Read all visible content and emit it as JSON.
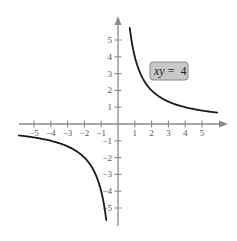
{
  "chart_data": {
    "type": "line",
    "title": "",
    "equation_label": "xy = 4",
    "equation_parts": {
      "vars": "xy",
      "rest": " =  4"
    },
    "function": "y = 4/x",
    "xlabel": "",
    "ylabel": "",
    "xlim": [
      -6,
      6.5
    ],
    "ylim": [
      -6,
      6.5
    ],
    "grid": false,
    "x_ticks": [
      -5,
      -4,
      -3,
      -2,
      -1,
      1,
      2,
      3,
      4,
      5
    ],
    "y_ticks": [
      -5,
      -4,
      -3,
      -2,
      -1,
      1,
      2,
      3,
      4,
      5
    ],
    "x_tick_labels": [
      "−5",
      "−4",
      "−3",
      "−2",
      "−1",
      "1",
      "2",
      "3",
      "4",
      "5"
    ],
    "y_tick_labels": [
      "−5",
      "−4",
      "−3",
      "−2",
      "−1",
      "1",
      "2",
      "3",
      "4",
      "5"
    ],
    "series": [
      {
        "name": "upper branch (x > 0)",
        "x": [
          0.7,
          0.8,
          1,
          1.5,
          2,
          2.5,
          3,
          4,
          5,
          5.9
        ],
        "y": [
          5.71,
          5,
          4,
          2.67,
          2,
          1.6,
          1.33,
          1,
          0.8,
          0.68
        ]
      },
      {
        "name": "lower branch (x < 0)",
        "x": [
          -5.9,
          -5,
          -4,
          -3,
          -2.5,
          -2,
          -1.5,
          -1,
          -0.8,
          -0.7
        ],
        "y": [
          -0.68,
          -0.8,
          -1,
          -1.33,
          -1.6,
          -2,
          -2.67,
          -4,
          -5,
          -5.71
        ]
      }
    ],
    "colors": {
      "axis": "#8a8a8a",
      "curve": "#1a1a1a",
      "label_fill": "#c8c8c8",
      "label_stroke": "#8a8a8a"
    }
  }
}
